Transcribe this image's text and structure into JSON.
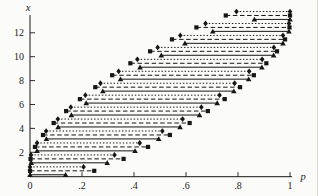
{
  "figure": {
    "background": "#fbfbf9",
    "ink": "#161616"
  },
  "chart_data": {
    "type": "line",
    "subtype": "horizontal-interval-staircase",
    "title": "",
    "xlabel": "p",
    "ylabel": "x",
    "xlim": [
      0,
      1
    ],
    "ylim": [
      0,
      13.8
    ],
    "grid": false,
    "legend_position": "none",
    "x_tick_values": [
      0,
      0.2,
      0.4,
      0.6,
      0.8,
      1
    ],
    "x_tick_labels": [
      "0",
      ".2",
      ".4",
      ".6",
      ".8",
      "1"
    ],
    "y_tick_values": [
      2,
      4,
      6,
      8,
      10,
      12
    ],
    "y_tick_labels": [
      "2",
      "4",
      "6",
      "8",
      "10",
      "12"
    ],
    "x_levels": [
      0,
      1,
      2,
      3,
      4,
      5,
      6,
      7,
      8,
      9,
      10,
      11,
      12,
      13
    ],
    "series": [
      {
        "name": "dashed-squares",
        "line_style": "dashed",
        "marker": "square",
        "level_offset": 0.45,
        "intervals": [
          [
            0.0,
            0.247
          ],
          [
            0.002,
            0.36
          ],
          [
            0.019,
            0.454
          ],
          [
            0.05,
            0.538
          ],
          [
            0.091,
            0.614
          ],
          [
            0.139,
            0.684
          ],
          [
            0.192,
            0.749
          ],
          [
            0.251,
            0.808
          ],
          [
            0.316,
            0.861
          ],
          [
            0.386,
            0.909
          ],
          [
            0.462,
            0.95
          ],
          [
            0.546,
            0.981
          ],
          [
            0.64,
            0.998
          ],
          [
            0.753,
            1.0
          ]
        ]
      },
      {
        "name": "dotted-diamonds",
        "line_style": "dotted",
        "marker": "diamond",
        "level_offset": 0.78,
        "intervals": [
          [
            0.0,
            0.206
          ],
          [
            0.004,
            0.325
          ],
          [
            0.027,
            0.422
          ],
          [
            0.062,
            0.509
          ],
          [
            0.107,
            0.587
          ],
          [
            0.157,
            0.659
          ],
          [
            0.213,
            0.729
          ],
          [
            0.271,
            0.787
          ],
          [
            0.341,
            0.843
          ],
          [
            0.413,
            0.893
          ],
          [
            0.491,
            0.938
          ],
          [
            0.578,
            0.973
          ],
          [
            0.675,
            0.996
          ],
          [
            0.794,
            1.0
          ]
        ]
      },
      {
        "name": "solid-triangles",
        "line_style": "solid",
        "marker": "triangle",
        "level_offset": 0.12,
        "intervals": [
          [
            0.0,
            0.137
          ],
          [
            0.005,
            0.297
          ],
          [
            0.027,
            0.404
          ],
          [
            0.063,
            0.495
          ],
          [
            0.108,
            0.577
          ],
          [
            0.159,
            0.652
          ],
          [
            0.216,
            0.72
          ],
          [
            0.28,
            0.784
          ],
          [
            0.348,
            0.841
          ],
          [
            0.423,
            0.892
          ],
          [
            0.505,
            0.937
          ],
          [
            0.596,
            0.973
          ],
          [
            0.703,
            0.996
          ],
          [
            0.863,
            1.0
          ]
        ]
      }
    ]
  }
}
